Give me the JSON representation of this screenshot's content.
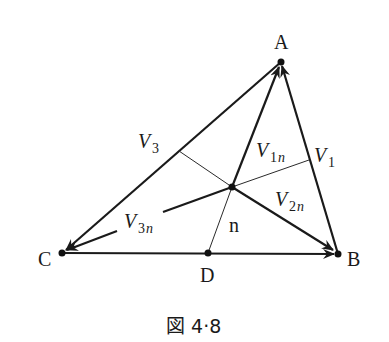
{
  "figure": {
    "caption": "図 4·8",
    "points": {
      "A": {
        "label": "A",
        "x": 281,
        "y": 62
      },
      "B": {
        "label": "B",
        "x": 338,
        "y": 254
      },
      "C": {
        "label": "C",
        "x": 62,
        "y": 253
      },
      "D": {
        "label": "D",
        "x": 208,
        "y": 253
      },
      "P": {
        "label": "",
        "x": 232,
        "y": 187
      }
    },
    "labels": {
      "V1": {
        "main": "V",
        "sub": "1"
      },
      "V2n": {
        "main": "V",
        "sub_num": "2",
        "sub_var": "n"
      },
      "V3": {
        "main": "V",
        "sub": "3"
      },
      "V1n": {
        "main": "V",
        "sub_num": "1",
        "sub_var": "n"
      },
      "V3n": {
        "main": "V",
        "sub_num": "3",
        "sub_var": "n"
      },
      "n": "n"
    },
    "colors": {
      "line": "#1a1a1a",
      "background": "#ffffff"
    }
  }
}
